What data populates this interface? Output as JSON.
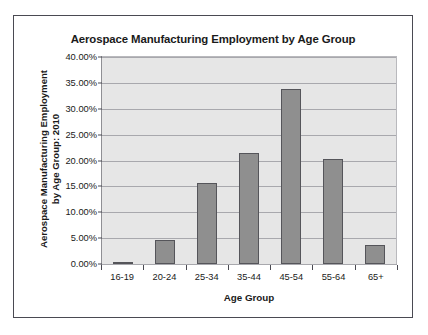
{
  "chart_data": {
    "type": "bar",
    "title": "Aerospace Manufacturing Employment by Age Group",
    "xlabel": "Age Group",
    "ylabel": "Aerospace Manufacturing Employment by Age Group: 2010",
    "ylabel_lines": [
      "Aerospace Manufacturing Employment",
      "by Age Group: 2010"
    ],
    "categories": [
      "16-19",
      "20-24",
      "25-34",
      "35-44",
      "45-54",
      "55-64",
      "65+"
    ],
    "values": [
      0.4,
      4.6,
      15.7,
      21.5,
      33.8,
      20.3,
      3.7
    ],
    "value_labels": [
      "0.40%",
      "4.60%",
      "15.70%",
      "21.50%",
      "33.80%",
      "20.30%",
      "3.70%"
    ],
    "ylim": [
      0,
      40
    ],
    "ytick_values": [
      0,
      5,
      10,
      15,
      20,
      25,
      30,
      35,
      40
    ],
    "ytick_labels": [
      "0.00%",
      "5.00%",
      "10.00%",
      "15.00%",
      "20.00%",
      "25.00%",
      "30.00%",
      "35.00%",
      "40.00%"
    ],
    "grid": true,
    "legend": false,
    "legend_position": "none",
    "colors": {
      "bar_fill": "#8f8f8f",
      "bar_border": "#55555a",
      "plot_background": "#e6e6e6",
      "gridline": "#a8a8ad",
      "frame_border": "#4a4a52",
      "text": "#1a1a1a",
      "page_background": "#ffffff"
    }
  }
}
